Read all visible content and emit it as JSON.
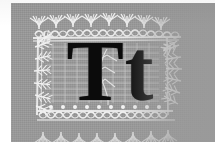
{
  "image": {
    "kind": "specimen-plate",
    "subject": "letter-specimen",
    "title": "Tt",
    "description": "Black serif capital and lowercase letter T on a gray panel framed by a white ornamental foliate border"
  },
  "panel": {
    "background_color": "#9a9a9a",
    "paper_color": "#ffffff",
    "ink_color": "#0b0b0b",
    "ornament_color": "#f2f2f2"
  },
  "letters": {
    "uppercase": "T",
    "lowercase": "t",
    "combined": "Tt"
  },
  "border": {
    "style": "foliate-palmette",
    "elements": [
      "palmette-fan",
      "beaded-row",
      "braided-band",
      "fern-frond",
      "leaf-spray"
    ]
  },
  "margins": {
    "left_label": "11",
    "top_label": "3",
    "bottom_label": "6"
  }
}
